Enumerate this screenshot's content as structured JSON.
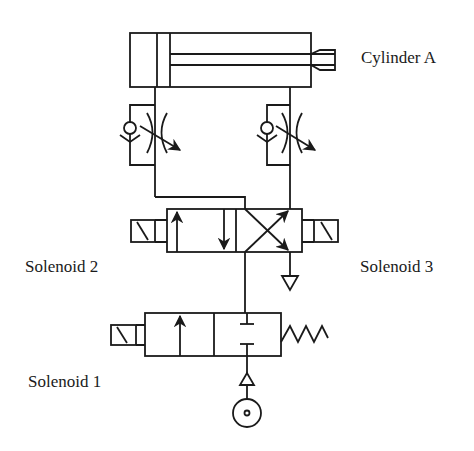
{
  "diagram": {
    "type": "pneumatic-circuit",
    "stroke_color": "#1a1a1a",
    "background": "#ffffff",
    "labels": {
      "cylinder": "Cylinder A",
      "solenoid_2": "Solenoid 2",
      "solenoid_3": "Solenoid 3",
      "solenoid_1": "Solenoid 1"
    },
    "components": [
      {
        "id": "cylinder-a",
        "kind": "double-acting-cylinder"
      },
      {
        "id": "flow-control-left",
        "kind": "one-way-flow-control-valve"
      },
      {
        "id": "flow-control-right",
        "kind": "one-way-flow-control-valve"
      },
      {
        "id": "valve-4-3",
        "kind": "directional-control-valve",
        "positions": 2,
        "actuators": [
          "solenoid-2",
          "solenoid-3"
        ]
      },
      {
        "id": "exhaust",
        "kind": "exhaust-port"
      },
      {
        "id": "valve-3-2",
        "kind": "directional-control-valve",
        "positions": 2,
        "actuators": [
          "solenoid-1",
          "spring-return"
        ]
      },
      {
        "id": "pressure-source",
        "kind": "compressor-source"
      }
    ]
  }
}
